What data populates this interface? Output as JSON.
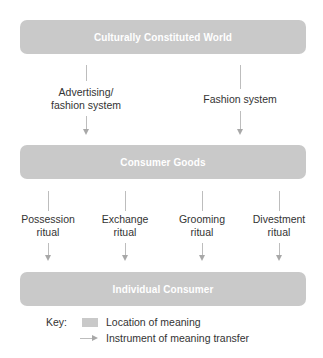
{
  "diagram": {
    "type": "flow",
    "colors": {
      "box_fill": "#c9c9c9",
      "box_text": "#ffffff",
      "arrow": "#a8a8a8",
      "text": "#333333"
    },
    "levels": {
      "world": "Culturally Constituted World",
      "goods": "Consumer Goods",
      "consumer": "Individual Consumer"
    },
    "instruments_top": [
      {
        "line1": "Advertising/",
        "line2": "fashion system"
      },
      {
        "line1": "Fashion system",
        "line2": ""
      }
    ],
    "instruments_bottom": [
      {
        "line1": "Possession",
        "line2": "ritual"
      },
      {
        "line1": "Exchange",
        "line2": "ritual"
      },
      {
        "line1": "Grooming",
        "line2": "ritual"
      },
      {
        "line1": "Divestment",
        "line2": "ritual"
      }
    ],
    "key": {
      "title": "Key:",
      "location_label": "Location of meaning",
      "instrument_label": "Instrument of meaning transfer"
    }
  }
}
